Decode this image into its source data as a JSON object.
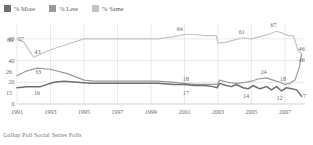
{
  "legend": {
    "position": "top-left",
    "items": [
      {
        "label": "% More",
        "color": "#6e6e6e",
        "key": "more"
      },
      {
        "label": "% Less",
        "color": "#9a9a9a",
        "key": "less"
      },
      {
        "label": "% Same",
        "color": "#c4c4c4",
        "key": "same"
      }
    ]
  },
  "footer": {
    "source": "Gallup Poll Social Series Polls"
  },
  "chart_data": {
    "type": "line",
    "title": "",
    "subtitle": "",
    "xlabel": "",
    "ylabel": "",
    "ylim": [
      0,
      70
    ],
    "yticks": [
      0,
      20,
      40,
      60
    ],
    "xlim": [
      1991,
      2008.2
    ],
    "xticks": [
      1991,
      1993,
      1995,
      1997,
      1999,
      2001,
      2003,
      2005,
      2007
    ],
    "xticklabels": [
      "1991",
      "1993",
      "1995",
      "1997",
      "1999",
      "2001",
      "2003",
      "2005",
      "2007"
    ],
    "grid": true,
    "legend_position": "top-left",
    "source": "Gallup Poll Social Series Polls",
    "series": [
      {
        "name": "% Same",
        "color": "#c4c4c4",
        "x": [
          1991,
          1991.4,
          1992,
          1993,
          1994,
          1995,
          1995.6,
          1996.4,
          1997.4,
          1998.4,
          1999.4,
          2000.4,
          2001,
          2001.6,
          2002.2,
          2002.6,
          2002.9,
          2003.0,
          2003.5,
          2004.0,
          2004.5,
          2005.0,
          2005.5,
          2006.0,
          2006.5,
          2006.9,
          2007.2,
          2007.5,
          2007.8,
          2008.0
        ],
        "y": [
          60,
          57,
          43,
          50,
          55,
          60,
          60,
          60,
          60,
          60,
          60,
          62,
          64,
          64,
          63,
          63,
          63,
          56,
          57,
          59,
          61,
          60,
          62,
          64,
          67,
          65,
          63,
          63,
          49,
          46
        ]
      },
      {
        "name": "% Less",
        "color": "#9a9a9a",
        "x": [
          1991,
          1991.5,
          1992.2,
          1993,
          1994,
          1995,
          1995.6,
          1996.4,
          1997.4,
          1998.4,
          1999.4,
          2000.4,
          2001,
          2001.6,
          2002.2,
          2002.7,
          2002.95,
          2003.1,
          2003.6,
          2004.1,
          2004.6,
          2005.0,
          2005.4,
          2005.9,
          2006.3,
          2006.7,
          2007.0,
          2007.3,
          2007.6,
          2007.85,
          2008.0
        ],
        "y": [
          26,
          30,
          33,
          32,
          28,
          22,
          21,
          21,
          21,
          21,
          21,
          20,
          19,
          18,
          18,
          18,
          18,
          22,
          20,
          19,
          20,
          21,
          23,
          24,
          22,
          20,
          18,
          19,
          22,
          33,
          46
        ]
      },
      {
        "name": "% More",
        "color": "#6e6e6e",
        "x": [
          1991,
          1991.6,
          1992.4,
          1993.2,
          1993.8,
          1994.6,
          1995.4,
          1996.4,
          1997.4,
          1998.4,
          1999.4,
          2000.4,
          2001,
          2001.6,
          2002.2,
          2002.7,
          2002.95,
          2003.1,
          2003.5,
          2003.8,
          2004.1,
          2004.5,
          2004.8,
          2005.1,
          2005.5,
          2005.9,
          2006.2,
          2006.5,
          2006.8,
          2007.1,
          2007.4,
          2007.7,
          2008.0
        ],
        "y": [
          15,
          16,
          16,
          20,
          21,
          20,
          19,
          19,
          19,
          19,
          19,
          18,
          18,
          17,
          17,
          16,
          15,
          19,
          17,
          16,
          18,
          15,
          14,
          17,
          14,
          16,
          13,
          16,
          12,
          15,
          14,
          13,
          7
        ]
      }
    ],
    "annotations": [
      {
        "text": "60",
        "x": 1991.0,
        "y": 60,
        "dx": -7,
        "dy": 3
      },
      {
        "text": "57",
        "x": 1991.35,
        "y": 57,
        "dx": -2,
        "dy": -1
      },
      {
        "text": "43",
        "x": 1992.1,
        "y": 43,
        "dx": 2,
        "dy": -3
      },
      {
        "text": "64",
        "x": 2000.9,
        "y": 64,
        "dx": -3,
        "dy": -4
      },
      {
        "text": "61",
        "x": 2004.6,
        "y": 61,
        "dx": -3,
        "dy": -4
      },
      {
        "text": "67",
        "x": 2006.5,
        "y": 67,
        "dx": -3,
        "dy": -4
      },
      {
        "text": "46",
        "x": 2008.0,
        "y": 46,
        "dx": 0,
        "dy": -3
      },
      {
        "text": "26",
        "x": 1991.0,
        "y": 26,
        "dx": -8,
        "dy": -2
      },
      {
        "text": "33",
        "x": 1992.2,
        "y": 33,
        "dx": 1,
        "dy": 6
      },
      {
        "text": "18",
        "x": 2001.2,
        "y": 18,
        "dx": -2,
        "dy": -3
      },
      {
        "text": "24",
        "x": 2005.9,
        "y": 24,
        "dx": -3,
        "dy": -4
      },
      {
        "text": "18",
        "x": 2007.0,
        "y": 18,
        "dx": -2,
        "dy": -3
      },
      {
        "text": "46",
        "x": 2008.0,
        "y": 46,
        "dx": 0,
        "dy": 8
      },
      {
        "text": "15",
        "x": 1991.0,
        "y": 15,
        "dx": -8,
        "dy": 7
      },
      {
        "text": "16",
        "x": 1992.2,
        "y": 16,
        "dx": 0,
        "dy": 8
      },
      {
        "text": "17",
        "x": 2001.2,
        "y": 17,
        "dx": -2,
        "dy": 9
      },
      {
        "text": "14",
        "x": 2004.8,
        "y": 14,
        "dx": -2,
        "dy": 9
      },
      {
        "text": "12",
        "x": 2006.8,
        "y": 12,
        "dx": -2,
        "dy": 9
      },
      {
        "text": "7",
        "x": 2008.0,
        "y": 7,
        "dx": 3,
        "dy": 2
      }
    ]
  }
}
